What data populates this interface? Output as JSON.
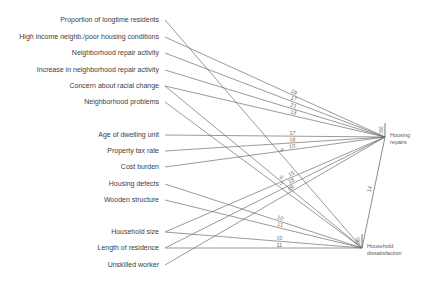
{
  "diagram": {
    "variables": [
      {
        "label": "Proportion of longtime residents",
        "y": 20
      },
      {
        "label": "High income neighb./poor housing conditions",
        "y": 37
      },
      {
        "label": "Neighborhood repair activity",
        "y": 53
      },
      {
        "label": "Increase in neighborhood repair activity",
        "y": 70
      },
      {
        "label": "Concern about racial change",
        "y": 86
      },
      {
        "label": "Neighborhood problems",
        "y": 102
      },
      {
        "label": "Age of dwelling unit",
        "y": 135
      },
      {
        "label": "Property tax rate",
        "y": 151
      },
      {
        "label": "Cost burden",
        "y": 167
      },
      {
        "label": "Housing defects",
        "y": 184
      },
      {
        "label": "Wooden structure",
        "y": 200
      },
      {
        "label": "Household size",
        "y": 232
      },
      {
        "label": "Length of residence",
        "y": 248
      },
      {
        "label": "Unskilled worker",
        "y": 265
      }
    ],
    "outcomes": [
      {
        "id": "repairs",
        "label_line1": "Housing",
        "label_line2": "repairs",
        "x": 385,
        "y": 137,
        "r2": ".306"
      },
      {
        "id": "dissatisfaction",
        "label_line1": "Household",
        "label_line2": "dissatisfaction",
        "x": 362,
        "y": 248,
        "r2": ".385"
      }
    ],
    "paths": [
      {
        "from": 0,
        "to": "dissatisfaction",
        "coef": "9"
      },
      {
        "from": 1,
        "to": "repairs",
        "coef": "19"
      },
      {
        "from": 2,
        "to": "repairs",
        "coef": "17"
      },
      {
        "from": 3,
        "to": "repairs",
        "coef": "21"
      },
      {
        "from": 4,
        "to": "repairs",
        "coef": "13"
      },
      {
        "from": 4,
        "to": "dissatisfaction",
        "coef": "8"
      },
      {
        "from": 5,
        "to": "dissatisfaction",
        "coef": "7"
      },
      {
        "from": 6,
        "to": "repairs",
        "coef": "17"
      },
      {
        "from": 7,
        "to": "repairs",
        "coef": "18"
      },
      {
        "from": 8,
        "to": "repairs",
        "coef": "10"
      },
      {
        "from": 9,
        "to": "dissatisfaction",
        "coef": "10"
      },
      {
        "from": 10,
        "to": "dissatisfaction",
        "coef": "11"
      },
      {
        "from": 11,
        "to": "repairs",
        "coef": "15"
      },
      {
        "from": 11,
        "to": "dissatisfaction",
        "coef": "10"
      },
      {
        "from": 12,
        "to": "repairs",
        "coef": "18"
      },
      {
        "from": 12,
        "to": "dissatisfaction",
        "coef": "11"
      },
      {
        "from": 13,
        "to": "repairs",
        "coef": "09"
      }
    ],
    "link": {
      "from": "dissatisfaction",
      "to": "repairs",
      "coef": "14"
    },
    "line_color": "#6e6e6e"
  }
}
